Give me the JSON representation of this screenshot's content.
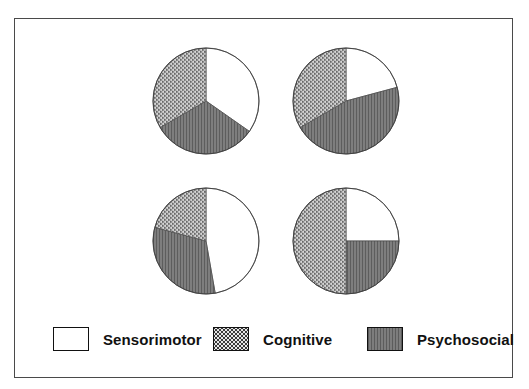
{
  "figure": {
    "border_color": "#4a4a4a",
    "background": "#ffffff"
  },
  "legend": {
    "position": "bottom",
    "entries": [
      {
        "label": "Sensorimotor",
        "swatch": "swatch-sensorimotor",
        "color": "#ffffff",
        "pattern": "solid-white",
        "icon": "legend-swatch-icon"
      },
      {
        "label": "Cognitive",
        "swatch": "swatch-cognitive",
        "color": "#e6e6e6",
        "pattern": "stipple-dots",
        "icon": "legend-swatch-icon"
      },
      {
        "label": "Psychosocial",
        "swatch": "swatch-psychosocial",
        "color": "#6f6f6f",
        "pattern": "vertical-lines",
        "icon": "legend-swatch-icon"
      }
    ]
  },
  "chart_data": {
    "type": "pie",
    "title": "",
    "subtitle": "",
    "xlabel": "",
    "ylabel": "",
    "grid": false,
    "legend_position": "bottom",
    "categories": [
      "Sensorimotor",
      "Cognitive",
      "Psychosocial"
    ],
    "colors": [
      "#ffffff",
      "#e6e6e6",
      "#6f6f6f"
    ],
    "patterns": [
      "solid-white",
      "stipple-dots",
      "vertical-lines"
    ],
    "start_angle_deg": 0,
    "direction": "clockwise",
    "panels": [
      {
        "name": "pie-top-left",
        "row": 0,
        "col": 0,
        "slice_order": [
          "Sensorimotor",
          "Psychosocial",
          "Cognitive"
        ],
        "angles_deg": [
          125,
          115,
          120
        ],
        "values_pct": [
          34.7,
          31.9,
          33.3
        ]
      },
      {
        "name": "pie-top-right",
        "row": 0,
        "col": 1,
        "slice_order": [
          "Sensorimotor",
          "Psychosocial",
          "Cognitive"
        ],
        "angles_deg": [
          75,
          165,
          120
        ],
        "values_pct": [
          20.8,
          45.8,
          33.3
        ]
      },
      {
        "name": "pie-bottom-left",
        "row": 1,
        "col": 0,
        "slice_order": [
          "Sensorimotor",
          "Psychosocial",
          "Cognitive"
        ],
        "angles_deg": [
          170,
          115,
          75
        ],
        "values_pct": [
          47.2,
          31.9,
          20.8
        ]
      },
      {
        "name": "pie-bottom-right",
        "row": 1,
        "col": 1,
        "slice_order": [
          "Sensorimotor",
          "Psychosocial",
          "Cognitive"
        ],
        "angles_deg": [
          90,
          90,
          180
        ],
        "values_pct": [
          25.0,
          25.0,
          50.0
        ]
      }
    ]
  }
}
